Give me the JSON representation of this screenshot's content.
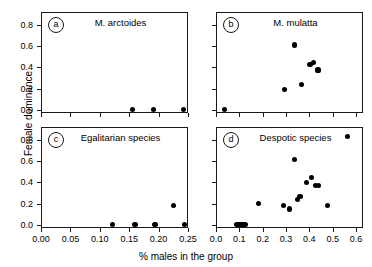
{
  "figure": {
    "ylabel": "Female dominance",
    "xlabel": "% males in the group"
  },
  "panels": [
    {
      "tag": "a",
      "title": "M. arctoides"
    },
    {
      "tag": "b",
      "title": "M. mulatta"
    },
    {
      "tag": "c",
      "title": "Egalitarian species"
    },
    {
      "tag": "d",
      "title": "Despotic species"
    }
  ],
  "axes": {
    "y_ticks": [
      "0.0",
      "0.2",
      "0.4",
      "0.6",
      "0.8"
    ],
    "x_ticks_left": [
      "0.00",
      "0.05",
      "0.10",
      "0.15",
      "0.20",
      "0.25"
    ],
    "x_ticks_right": [
      "0.0",
      "0.1",
      "0.2",
      "0.3",
      "0.4",
      "0.5",
      "0.6"
    ]
  },
  "chart_data": [
    {
      "type": "scatter",
      "panel": "a",
      "title": "M. arctoides",
      "xlabel": "% males in the group",
      "ylabel": "Female dominance",
      "xlim": [
        0.0,
        0.25
      ],
      "ylim": [
        -0.03,
        0.92
      ],
      "xticks": [
        0.0,
        0.05,
        0.1,
        0.15,
        0.2,
        0.25
      ],
      "yticks": [
        0.0,
        0.2,
        0.4,
        0.6,
        0.8
      ],
      "grid": false,
      "legend": "none",
      "points": [
        {
          "x": 0.155,
          "y": 0.0
        },
        {
          "x": 0.192,
          "y": 0.0
        },
        {
          "x": 0.243,
          "y": 0.0
        }
      ]
    },
    {
      "type": "scatter",
      "panel": "b",
      "title": "M. mulatta",
      "xlabel": "% males in the group",
      "ylabel": "Female dominance",
      "xlim": [
        0.0,
        0.63
      ],
      "ylim": [
        -0.03,
        0.92
      ],
      "xticks": [
        0.0,
        0.1,
        0.2,
        0.3,
        0.4,
        0.5,
        0.6
      ],
      "yticks": [
        0.0,
        0.2,
        0.4,
        0.6,
        0.8
      ],
      "grid": false,
      "legend": "none",
      "points": [
        {
          "x": 0.035,
          "y": 0.0
        },
        {
          "x": 0.293,
          "y": 0.19
        },
        {
          "x": 0.338,
          "y": 0.61
        },
        {
          "x": 0.368,
          "y": 0.235
        },
        {
          "x": 0.403,
          "y": 0.425
        },
        {
          "x": 0.419,
          "y": 0.445
        },
        {
          "x": 0.437,
          "y": 0.375
        }
      ]
    },
    {
      "type": "scatter",
      "panel": "c",
      "title": "Egalitarian species",
      "xlabel": "% males in the group",
      "ylabel": "Female dominance",
      "xlim": [
        0.0,
        0.25
      ],
      "ylim": [
        -0.03,
        0.92
      ],
      "xticks": [
        0.0,
        0.05,
        0.1,
        0.15,
        0.2,
        0.25
      ],
      "yticks": [
        0.0,
        0.2,
        0.4,
        0.6,
        0.8
      ],
      "grid": false,
      "legend": "none",
      "points": [
        {
          "x": 0.121,
          "y": 0.0
        },
        {
          "x": 0.16,
          "y": 0.0
        },
        {
          "x": 0.194,
          "y": 0.0
        },
        {
          "x": 0.226,
          "y": 0.178
        },
        {
          "x": 0.244,
          "y": 0.0
        }
      ]
    },
    {
      "type": "scatter",
      "panel": "d",
      "title": "Despotic species",
      "xlabel": "% males in the group",
      "ylabel": "Female dominance",
      "xlim": [
        0.0,
        0.63
      ],
      "ylim": [
        -0.03,
        0.92
      ],
      "xticks": [
        0.0,
        0.1,
        0.2,
        0.3,
        0.4,
        0.5,
        0.6
      ],
      "yticks": [
        0.0,
        0.2,
        0.4,
        0.6,
        0.8
      ],
      "grid": false,
      "legend": "none",
      "points": [
        {
          "x": 0.089,
          "y": 0.0
        },
        {
          "x": 0.096,
          "y": 0.0
        },
        {
          "x": 0.103,
          "y": 0.0
        },
        {
          "x": 0.11,
          "y": 0.0
        },
        {
          "x": 0.117,
          "y": 0.0
        },
        {
          "x": 0.124,
          "y": 0.0
        },
        {
          "x": 0.181,
          "y": 0.197
        },
        {
          "x": 0.288,
          "y": 0.185
        },
        {
          "x": 0.314,
          "y": 0.148
        },
        {
          "x": 0.338,
          "y": 0.615
        },
        {
          "x": 0.351,
          "y": 0.238
        },
        {
          "x": 0.36,
          "y": 0.268
        },
        {
          "x": 0.388,
          "y": 0.398
        },
        {
          "x": 0.408,
          "y": 0.447
        },
        {
          "x": 0.428,
          "y": 0.372
        },
        {
          "x": 0.44,
          "y": 0.368
        },
        {
          "x": 0.477,
          "y": 0.184
        },
        {
          "x": 0.563,
          "y": 0.828
        }
      ]
    }
  ]
}
